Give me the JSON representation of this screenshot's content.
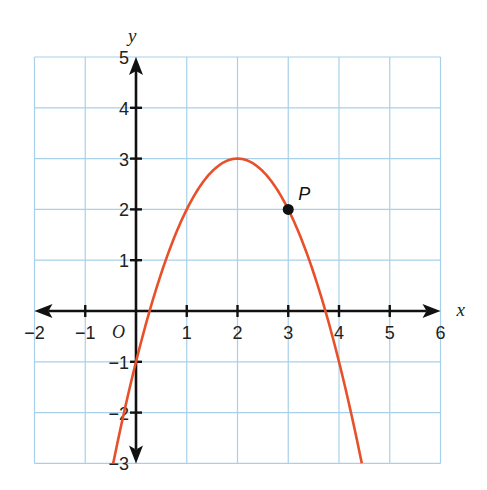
{
  "chart_data": {
    "type": "line",
    "title": "",
    "xlabel": "x",
    "ylabel": "y",
    "xlim": [
      -2,
      6
    ],
    "ylim": [
      -3,
      5
    ],
    "grid": true,
    "x_ticks": [
      -2,
      -1,
      1,
      2,
      3,
      4,
      5,
      6
    ],
    "y_ticks": [
      -3,
      -2,
      -1,
      1,
      2,
      3,
      4,
      5
    ],
    "x_tick_labels": [
      "−2",
      "−1",
      "1",
      "2",
      "3",
      "4",
      "5",
      "6"
    ],
    "y_tick_labels": [
      "−3",
      "−2",
      "−1",
      "1",
      "2",
      "3",
      "4",
      "5"
    ],
    "origin_label": "O",
    "series": [
      {
        "name": "parabola",
        "equation": "y = -(x-2)^2 + 3",
        "x": [
          -0.449,
          0,
          0.5,
          1,
          1.5,
          2,
          2.5,
          3,
          3.5,
          4,
          4.449
        ],
        "values": [
          -3,
          -1,
          0.75,
          2,
          2.75,
          3,
          2.75,
          2,
          0.75,
          -1,
          -3
        ],
        "color": "#e8502a"
      }
    ],
    "annotations": [
      {
        "label": "P",
        "x": 3,
        "y": 2
      }
    ]
  },
  "colors": {
    "grid": "#a8d0ea",
    "axis": "#111111",
    "curve": "#e8502a",
    "point": "#111111"
  }
}
